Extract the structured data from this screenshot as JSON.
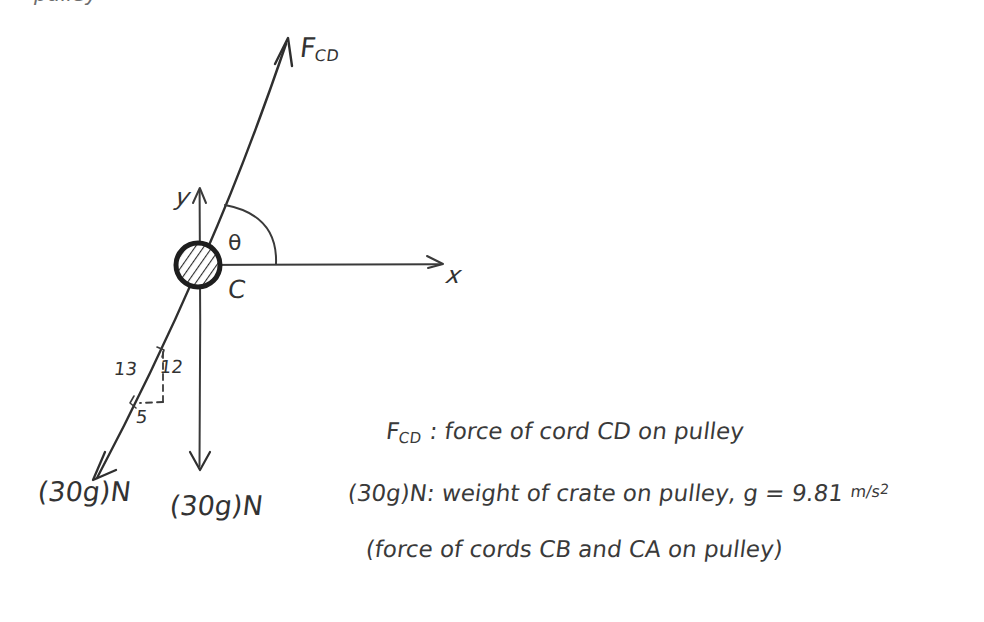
{
  "document": {
    "type": "hand-drawn free body diagram",
    "background_color": "#ffffff",
    "ink_color": "#333333",
    "top_cut_text": "pulley"
  },
  "diagram": {
    "origin_label": "C",
    "axes": {
      "x_label": "x",
      "y_label": "y"
    },
    "angle_label": "θ",
    "pulley": {
      "name": "pulley",
      "style": "hatched circle"
    },
    "vectors": [
      {
        "id": "fcd",
        "label_main": "F",
        "label_sub": "CD",
        "direction": "up-right",
        "description": "force of cord CD on pulley"
      },
      {
        "id": "weight-left",
        "label": "(30g)N",
        "direction": "down-left along 13-12-5 slope",
        "description": "force of cord CB on pulley"
      },
      {
        "id": "weight-down",
        "label": "(30g)N",
        "direction": "straight down",
        "description": "force of cord CA on pulley"
      }
    ],
    "slope_triangle": {
      "hypotenuse": "13",
      "vertical": "12",
      "horizontal": "5"
    }
  },
  "legend": {
    "line1": {
      "symbol_main": "F",
      "symbol_sub": "CD",
      "text": " : force of cord CD on pulley"
    },
    "line2": {
      "text_before": "(30g)N: weight of crate on pulley, g = 9.81 ",
      "unit_numerator": "m",
      "unit_divider": "/",
      "unit_denominator": "s",
      "unit_exponent": "2"
    },
    "line3": {
      "text": "(force of cords CB and CA on pulley)"
    }
  }
}
